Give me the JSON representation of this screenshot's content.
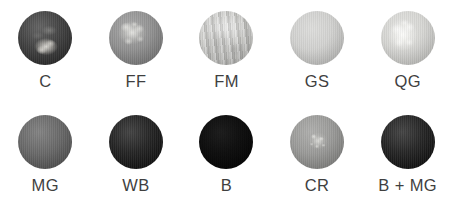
{
  "figure": {
    "type": "sample-image-grid",
    "background_color": "#ffffff",
    "label_color": "#3f3f3f",
    "rows": 2,
    "columns": 5,
    "samples": [
      {
        "label": "C",
        "row": 1,
        "column": 1,
        "appearance": "very dark charcoal disc with a pale granular cluster below centre",
        "base_color": "#3b3b3b",
        "feature_color": "#e4e2dc"
      },
      {
        "label": "FF",
        "row": 1,
        "column": 2,
        "appearance": "mid grey disc with a bright flocculent cluster above centre",
        "base_color": "#8d8d8d",
        "feature_color": "#ececf0"
      },
      {
        "label": "FM",
        "row": 1,
        "column": 3,
        "appearance": "pale grey disc with mottled fibrous marbled texture",
        "base_color": "#c6c6c3",
        "feature_color": "#ffffff"
      },
      {
        "label": "GS",
        "row": 1,
        "column": 4,
        "appearance": "smooth light grey disc with a single bright round highlight upper left",
        "base_color": "#cfcfcd",
        "feature_color": "#fcfcfa"
      },
      {
        "label": "QG",
        "row": 1,
        "column": 5,
        "appearance": "very pale disc with a bright crystalline granular mass left of centre",
        "base_color": "#d4d4d1",
        "feature_color": "#fffffd"
      },
      {
        "label": "MG",
        "row": 2,
        "column": 1,
        "appearance": "dark grey disc with radiating branched dendritic filaments",
        "base_color": "#636363",
        "feature_color": "#cdcdca"
      },
      {
        "label": "WB",
        "row": 2,
        "column": 2,
        "appearance": "near black disc with a pale ribbed organic mass on the right",
        "base_color": "#1b1b1b",
        "feature_color": "#e2e0da"
      },
      {
        "label": "B",
        "row": 2,
        "column": 3,
        "appearance": "solid black featureless disc",
        "base_color": "#0a0a0a",
        "feature_color": "#000000"
      },
      {
        "label": "CR",
        "row": 2,
        "column": 4,
        "appearance": "mid grey disc with a small pale speckled cluster at centre",
        "base_color": "#969694",
        "feature_color": "#ececf0"
      },
      {
        "label": "B + MG",
        "row": 2,
        "column": 5,
        "appearance": "near black disc with dark grey mottled cracked texture",
        "base_color": "#1c1c1c",
        "feature_color": "#545452"
      }
    ]
  }
}
